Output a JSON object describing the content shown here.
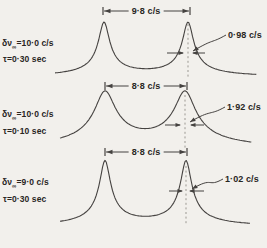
{
  "figure": {
    "bg_color": "#f2f0ec",
    "line_color": "#454240",
    "text_color": "#29261f",
    "panels": [
      {
        "id": "panel-1",
        "delta": {
          "base": "δν",
          "sub": "∞",
          "value": "=10·0 c/s"
        },
        "tau": "τ=0·30 sec",
        "separation_label": "9·8 c/s",
        "width_label": "0·98 c/s",
        "geom": {
          "curve": {
            "xStart": 55,
            "xEnd": 257,
            "baseline": 78,
            "peaks": [
              104,
              188
            ],
            "height": 54,
            "hw": 5.5,
            "pow": 0.6
          },
          "dim": {
            "y": 11,
            "x1": 103,
            "x2": 190
          },
          "dash": {
            "x": 188,
            "y1": 24,
            "y2": 77
          },
          "warrows": {
            "y": 53,
            "l1": 167,
            "l2": 184,
            "r1": 205,
            "r2": 192
          },
          "leader": {
            "sx": 226,
            "sy": 35,
            "ex": 193,
            "ey": 51
          }
        }
      },
      {
        "id": "panel-2",
        "delta": {
          "base": "δν",
          "sub": "∞",
          "value": "=10·0 c/s"
        },
        "tau": "τ=0·10 sec",
        "separation_label": "8·8 c/s",
        "width_label": "1·92 c/s",
        "geom": {
          "curve": {
            "xStart": 60,
            "xEnd": 252,
            "baseline": 151,
            "peaks": [
              105,
              185
            ],
            "height": 55,
            "hw": 10.5,
            "pow": 0.58
          },
          "dim": {
            "y": 86,
            "x1": 105,
            "x2": 187
          },
          "dash": {
            "x": 185,
            "y1": 95,
            "y2": 149
          },
          "warrows": {
            "y": 125,
            "l1": 165,
            "l2": 181,
            "r1": 204,
            "r2": 190
          },
          "leader": {
            "sx": 225,
            "sy": 107,
            "ex": 190,
            "ey": 122
          }
        }
      },
      {
        "id": "panel-3",
        "delta": {
          "base": "δν",
          "sub": "∞",
          "value": "=9·0 c/s"
        },
        "tau": "τ=0·30 sec",
        "separation_label": "8·8 c/s",
        "width_label": "1·02 c/s",
        "geom": {
          "curve": {
            "xStart": 60,
            "xEnd": 251,
            "baseline": 228,
            "peaks": [
              105,
              186
            ],
            "height": 65,
            "hw": 5.5,
            "pow": 0.6
          },
          "dim": {
            "y": 152,
            "x1": 105,
            "x2": 187
          },
          "dash": {
            "x": 186,
            "y1": 166,
            "y2": 225
          },
          "warrows": {
            "y": 191,
            "l1": 169,
            "l2": 183,
            "r1": 204,
            "r2": 189
          },
          "leader": {
            "sx": 223,
            "sy": 179,
            "ex": 192,
            "ey": 189
          }
        }
      }
    ]
  }
}
